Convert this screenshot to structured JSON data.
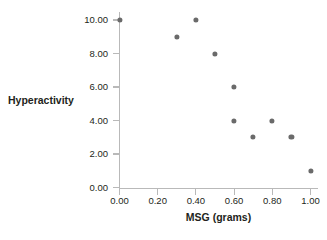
{
  "chart_data": {
    "type": "scatter",
    "title": "",
    "xlabel": "MSG (grams)",
    "ylabel": "Hyperactivity",
    "xlim": [
      0.0,
      1.0
    ],
    "ylim": [
      0.0,
      10.0
    ],
    "grid": false,
    "legend": null,
    "marker_color": "#6a6a6a",
    "axis_color": "#b9b9b9",
    "xticks": [
      {
        "value": 0.0,
        "label": "0.00"
      },
      {
        "value": 0.2,
        "label": "0.20"
      },
      {
        "value": 0.4,
        "label": "0.40"
      },
      {
        "value": 0.6,
        "label": "0.60"
      },
      {
        "value": 0.8,
        "label": "0.80"
      },
      {
        "value": 1.0,
        "label": "1.00"
      }
    ],
    "yticks": [
      {
        "value": 10.0,
        "label": "10.00"
      },
      {
        "value": 8.0,
        "label": "8.00"
      },
      {
        "value": 6.0,
        "label": "6.00"
      },
      {
        "value": 4.0,
        "label": "4.00"
      },
      {
        "value": 2.0,
        "label": "2.00"
      },
      {
        "value": 0.0,
        "label": "0.00"
      }
    ],
    "points": [
      {
        "x": 0.0,
        "y": 10.0
      },
      {
        "x": 0.3,
        "y": 9.0
      },
      {
        "x": 0.4,
        "y": 10.0
      },
      {
        "x": 0.5,
        "y": 8.0
      },
      {
        "x": 0.6,
        "y": 6.0
      },
      {
        "x": 0.6,
        "y": 4.0
      },
      {
        "x": 0.7,
        "y": 3.0
      },
      {
        "x": 0.8,
        "y": 4.0
      },
      {
        "x": 0.9,
        "y": 3.0
      },
      {
        "x": 1.0,
        "y": 1.0
      }
    ]
  }
}
